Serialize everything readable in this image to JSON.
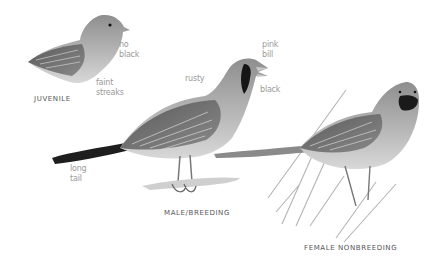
{
  "figures": [
    {
      "caption": "JUVENILE",
      "annotations": [
        {
          "line1": "no",
          "line2": "black"
        },
        {
          "line1": "faint",
          "line2": "streaks"
        }
      ]
    },
    {
      "caption": "MALE/BREEDING",
      "annotations": [
        {
          "line1": "pink",
          "line2": "bill"
        },
        {
          "line1": "rusty",
          "line2": ""
        },
        {
          "line1": "black",
          "line2": ""
        },
        {
          "line1": "long",
          "line2": "tail"
        }
      ]
    },
    {
      "caption": "FEMALE NONBREEDING",
      "annotations": []
    }
  ],
  "colors": {
    "background": "#ffffff",
    "annotation_text": "#9a9a9a",
    "caption_text": "#555555",
    "bird_body": "#a8a8a8",
    "bird_dark": "#2a2a2a"
  }
}
